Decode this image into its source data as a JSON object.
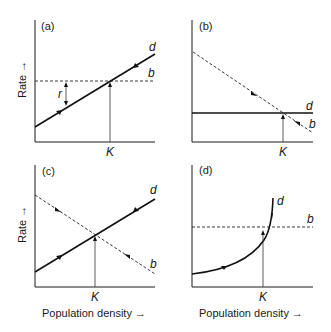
{
  "figure": {
    "y_axis_label": "Rate →",
    "x_axis_label": "Population density →",
    "panels": [
      {
        "id": "a",
        "label": "(a)",
        "curve_d": "d",
        "curve_b": "b",
        "equilibrium": "K",
        "annotation": "r",
        "description": "Density-dependent death rate d (increasing line) and density-independent birth rate b (horizontal dashed); r marks the difference b - d"
      },
      {
        "id": "b",
        "label": "(b)",
        "curve_d": "d",
        "curve_b": "b",
        "equilibrium": "K",
        "description": "Density-dependent birth rate b (decreasing dashed) and constant death rate d (horizontal solid)"
      },
      {
        "id": "c",
        "label": "(c)",
        "curve_d": "d",
        "curve_b": "b",
        "equilibrium": "K",
        "description": "Both rates density dependent: d increases, b decreases"
      },
      {
        "id": "d",
        "label": "(d)",
        "curve_d": "d",
        "curve_b": "b",
        "equilibrium": "K",
        "description": "Death rate d increases exponentially (curve), birth rate b constant (dashed)"
      }
    ]
  }
}
